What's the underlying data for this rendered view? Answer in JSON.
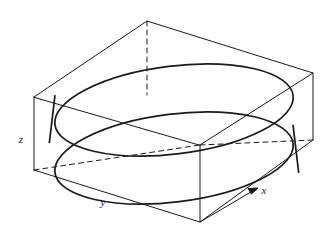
{
  "figure": {
    "title": "",
    "type": "3d-solid-region-diagram",
    "background_color": "#ffffff",
    "stroke_color": "#1a1a1a",
    "axes": {
      "x": {
        "label": "x",
        "position": {
          "x": 264,
          "y": 194
        }
      },
      "y": {
        "label": "y",
        "position": {
          "x": 103,
          "y": 206
        }
      },
      "z": {
        "label": "z",
        "position": {
          "x": 21,
          "y": 143
        }
      }
    },
    "box": {
      "name": "bounding-box",
      "top_face": [
        {
          "x": 34,
          "y": 97
        },
        {
          "x": 147,
          "y": 21
        },
        {
          "x": 313,
          "y": 73
        },
        {
          "x": 200,
          "y": 145
        }
      ],
      "bottom_face": [
        {
          "x": 34,
          "y": 170
        },
        {
          "x": 147,
          "y": 95
        },
        {
          "x": 313,
          "y": 140
        },
        {
          "x": 200,
          "y": 222
        }
      ],
      "vertical_edges": [
        {
          "from": {
            "x": 34,
            "y": 97
          },
          "to": {
            "x": 34,
            "y": 170
          },
          "hidden": false
        },
        {
          "from": {
            "x": 313,
            "y": 73
          },
          "to": {
            "x": 313,
            "y": 140
          },
          "hidden": false
        },
        {
          "from": {
            "x": 200,
            "y": 145
          },
          "to": {
            "x": 200,
            "y": 222
          },
          "hidden": false
        },
        {
          "from": {
            "x": 147,
            "y": 21
          },
          "to": {
            "x": 147,
            "y": 95
          },
          "hidden": true
        }
      ]
    },
    "cylinder": {
      "name": "cylinder-solid",
      "center_x": 174,
      "top_center_y": 110,
      "bottom_center_y": 158,
      "radius_x": 120,
      "radius_y": 44,
      "rotation_deg": -7,
      "stroke_width": 1.6
    },
    "arrow": {
      "name": "x-axis-arrow",
      "from": {
        "x": 200,
        "y": 222
      },
      "to": {
        "x": 258,
        "y": 188
      }
    }
  }
}
